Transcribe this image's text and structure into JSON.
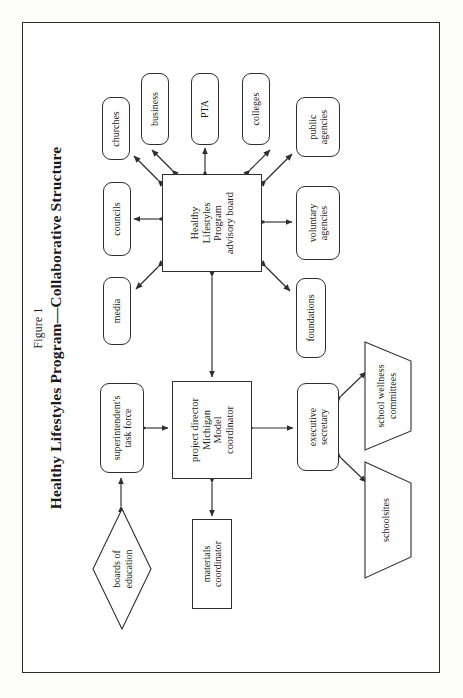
{
  "figure": {
    "label": "Figure 1",
    "title": "Healthy Lifestyles Program—Collaborative Structure",
    "orientation": "landscape-rotated-90ccw",
    "frame": true
  },
  "diagram": {
    "type": "organizational-flow",
    "central_node": {
      "id": "advisory-board",
      "shape": "rectangle",
      "lines": [
        "Healthy",
        "Lifestyles",
        "Program",
        "advisory board"
      ]
    },
    "nodes": [
      {
        "id": "churches",
        "shape": "rounded-rectangle",
        "lines": [
          "churches"
        ]
      },
      {
        "id": "business",
        "shape": "rounded-rectangle",
        "lines": [
          "business"
        ]
      },
      {
        "id": "pta",
        "shape": "rounded-rectangle",
        "lines": [
          "PTA"
        ]
      },
      {
        "id": "colleges",
        "shape": "rounded-rectangle",
        "lines": [
          "colleges"
        ]
      },
      {
        "id": "public-agencies",
        "shape": "rounded-rectangle",
        "lines": [
          "public",
          "agencies"
        ]
      },
      {
        "id": "councils",
        "shape": "rounded-rectangle",
        "lines": [
          "councils"
        ]
      },
      {
        "id": "voluntary-agencies",
        "shape": "rounded-rectangle",
        "lines": [
          "voluntary",
          "agencies"
        ]
      },
      {
        "id": "media",
        "shape": "rounded-rectangle",
        "lines": [
          "media"
        ]
      },
      {
        "id": "foundations",
        "shape": "rounded-rectangle",
        "lines": [
          "foundations"
        ]
      },
      {
        "id": "superintendents-task-force",
        "shape": "rounded-rectangle",
        "lines": [
          "superintendent's",
          "task force"
        ]
      },
      {
        "id": "project-director",
        "shape": "rectangle",
        "lines": [
          "project director",
          "Michigan",
          "Model",
          "coordinator"
        ]
      },
      {
        "id": "executive-secretary",
        "shape": "rounded-rectangle",
        "lines": [
          "executive",
          "secretary"
        ]
      },
      {
        "id": "materials-coordinator",
        "shape": "rectangle",
        "lines": [
          "materials",
          "coordinator"
        ]
      },
      {
        "id": "boards-of-education",
        "shape": "diamond",
        "lines": [
          "boards of",
          "education"
        ]
      },
      {
        "id": "school-wellness-committees",
        "shape": "trapezoid",
        "lines": [
          "school wellness",
          "committees"
        ]
      },
      {
        "id": "schoolsites",
        "shape": "trapezoid",
        "lines": [
          "schoolsites"
        ]
      }
    ],
    "connections": [
      {
        "from": "advisory-board",
        "to": "churches",
        "arrow": "double"
      },
      {
        "from": "advisory-board",
        "to": "business",
        "arrow": "double"
      },
      {
        "from": "advisory-board",
        "to": "pta",
        "arrow": "double"
      },
      {
        "from": "advisory-board",
        "to": "colleges",
        "arrow": "double"
      },
      {
        "from": "advisory-board",
        "to": "public-agencies",
        "arrow": "double"
      },
      {
        "from": "advisory-board",
        "to": "councils",
        "arrow": "double"
      },
      {
        "from": "advisory-board",
        "to": "voluntary-agencies",
        "arrow": "double"
      },
      {
        "from": "advisory-board",
        "to": "media",
        "arrow": "double"
      },
      {
        "from": "advisory-board",
        "to": "foundations",
        "arrow": "double"
      },
      {
        "from": "advisory-board",
        "to": "project-director",
        "arrow": "double"
      },
      {
        "from": "superintendents-task-force",
        "to": "project-director",
        "arrow": "double"
      },
      {
        "from": "boards-of-education",
        "to": "superintendents-task-force",
        "arrow": "double"
      },
      {
        "from": "project-director",
        "to": "materials-coordinator",
        "arrow": "double"
      },
      {
        "from": "project-director",
        "to": "executive-secretary",
        "arrow": "double"
      },
      {
        "from": "executive-secretary",
        "to": "school-wellness-committees",
        "arrow": "double"
      },
      {
        "from": "executive-secretary",
        "to": "schoolsites",
        "arrow": "double"
      }
    ]
  },
  "style": {
    "line_color": "#2e2e2e",
    "fill_color": "#ffffff",
    "page_color": "#fdfdfc",
    "text_color": "#1a1a1a"
  }
}
